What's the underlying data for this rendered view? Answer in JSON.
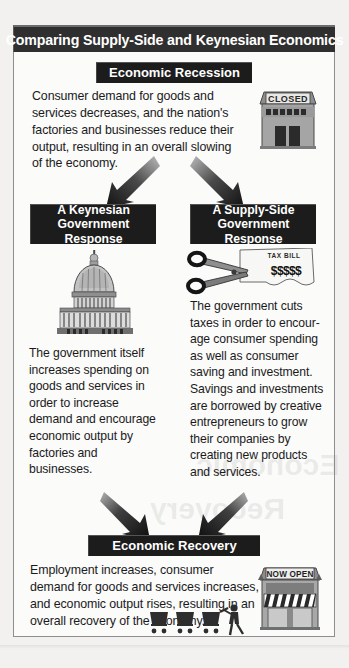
{
  "figure": {
    "title": "Comparing Supply-Side and Keynesian Economics"
  },
  "sections": {
    "recession": {
      "label": "Economic Recession",
      "body": "Consumer demand for goods and services decreases, and the nation's factories and businesses reduce their output, resulting in an overall slowing of the economy.",
      "icon": "closed-storefront-icon",
      "icon_sign_text": "CLOSED"
    },
    "keynesian": {
      "label": "A Keynesian\nGovernment Response",
      "label_line1": "A Keynesian",
      "label_line2": "Government Response",
      "body": "The government itself increases spending on goods and services in order to increase demand and encourage economic output by factories and businesses.",
      "icon": "capitol-building-icon"
    },
    "supply_side": {
      "label_line1": "A Supply-Side",
      "label_line2": "Government Response",
      "body": "The government cuts taxes in order to encour-age consumer spending as well as consumer saving and investment. Savings and investments are borrowed by creative entrepreneurs to grow their companies by creating new products and services.",
      "icon": "scissors-cutting-tax-bill-icon",
      "icon_paper_text": "TAX BILL",
      "icon_money_text": "$$$$$"
    },
    "recovery": {
      "label": "Economic Recovery",
      "body": "Employment increases, consumer demand for goods and services increases, and economic output rises, resulting in an overall recovery of the economy.",
      "icon": "open-storefront-icon",
      "icon_sign_text": "NOW OPEN",
      "icon_shoppers": "shoppers-with-carts-icon"
    }
  },
  "arrows": {
    "split_left": "arrow-down-left",
    "split_right": "arrow-down-right",
    "merge_left": "arrow-down-right",
    "merge_right": "arrow-down-left"
  },
  "colors": {
    "label_background": "#1c1c1c",
    "label_text": "#ffffff",
    "title_background": "#2f2f2f",
    "frame_border": "#8e8e8e",
    "page_background": "#f2f1ef",
    "figure_background": "#fbfbfa",
    "body_text": "#1a1a1a",
    "artwork_gray": "#9a9a9a"
  },
  "ghost_text": {
    "line_a": "Economic",
    "line_b": "Recovery"
  }
}
